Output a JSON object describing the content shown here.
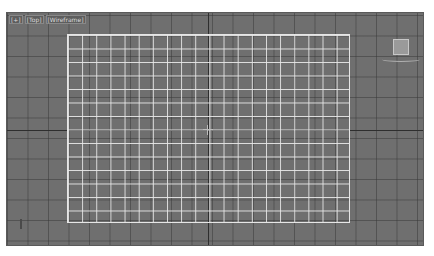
{
  "viewport": {
    "labels": [
      "[+]",
      "[Top]",
      "[Wireframe]"
    ],
    "background_color": "#6f6f6f",
    "grid_line_color": "#3c3c3c",
    "plane": {
      "name": "Plane",
      "color": "#e6e6e6",
      "columns": 20,
      "rows": 14
    },
    "viewcube": "viewcube-icon",
    "axis_tripod": "axis-tripod-icon"
  }
}
